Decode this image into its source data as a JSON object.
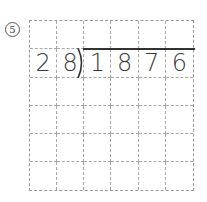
{
  "problem": {
    "number": "5",
    "number_symbol": "⑤",
    "type": "long-division",
    "divisor": "28",
    "dividend": "1876"
  },
  "grid": {
    "columns": 6,
    "rows": 6,
    "cells": [
      [
        "",
        "",
        "",
        "",
        "",
        ""
      ],
      [
        "2",
        "8",
        "1",
        "8",
        "7",
        "6"
      ],
      [
        "",
        "",
        "",
        "",
        "",
        ""
      ],
      [
        "",
        "",
        "",
        "",
        "",
        ""
      ],
      [
        "",
        "",
        "",
        "",
        "",
        ""
      ],
      [
        "",
        "",
        "",
        "",
        "",
        ""
      ]
    ]
  }
}
